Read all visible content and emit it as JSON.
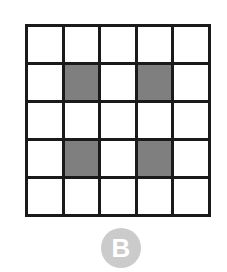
{
  "grid": {
    "rows": 5,
    "cols": 5,
    "filled_cells": [
      [
        1,
        1
      ],
      [
        1,
        3
      ],
      [
        3,
        1
      ],
      [
        3,
        3
      ]
    ],
    "colors": {
      "line": "#1a1a1a",
      "empty": "#ffffff",
      "filled": "#7f7f7f"
    }
  },
  "label": {
    "text": "B",
    "badge_color": "#cbcbcb"
  }
}
